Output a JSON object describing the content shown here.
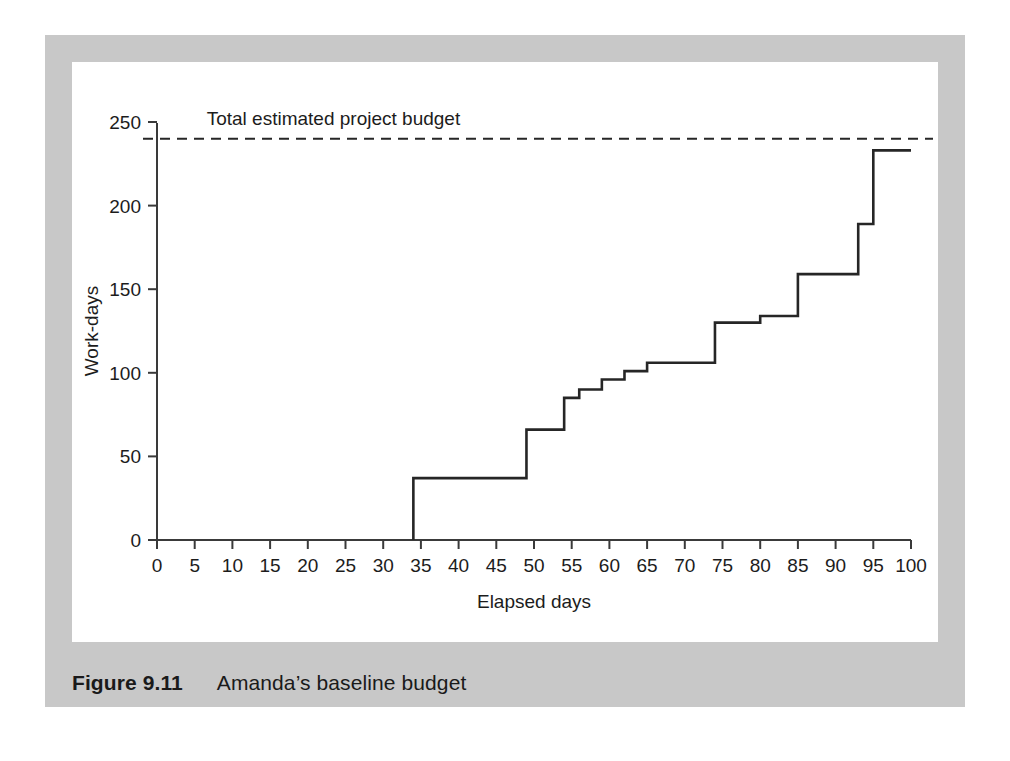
{
  "figure": {
    "caption_label": "Figure 9.11",
    "caption_text": "Amanda’s baseline budget",
    "panel_color": "#c8c8c8",
    "card_color": "#ffffff"
  },
  "chart_data": {
    "type": "line",
    "variant": "step",
    "title": "",
    "xlabel": "Elapsed days",
    "ylabel": "Work-days",
    "xlim": [
      0,
      100
    ],
    "ylim": [
      0,
      250
    ],
    "xticks": [
      0,
      5,
      10,
      15,
      20,
      25,
      30,
      35,
      40,
      45,
      50,
      55,
      60,
      65,
      70,
      75,
      80,
      85,
      90,
      95,
      100
    ],
    "yticks": [
      0,
      50,
      100,
      150,
      200,
      250
    ],
    "xtick_labels": [
      "0",
      "5",
      "10",
      "15",
      "20",
      "25",
      "30",
      "35",
      "40",
      "45",
      "50",
      "55",
      "60",
      "65",
      "70",
      "75",
      "80",
      "85",
      "90",
      "95",
      "100"
    ],
    "ytick_labels": [
      "0",
      "50",
      "100",
      "150",
      "200",
      "250"
    ],
    "grid": false,
    "legend": null,
    "series": [
      {
        "name": "Cumulative baseline budget",
        "color": "#262626",
        "line_width": 2.6,
        "x": [
          34,
          34,
          49,
          49,
          54,
          54,
          56,
          56,
          59,
          59,
          62,
          62,
          65,
          65,
          74,
          74,
          80,
          80,
          85,
          85,
          93,
          93,
          95,
          95,
          100
        ],
        "values": [
          0,
          37,
          37,
          66,
          66,
          85,
          85,
          90,
          90,
          96,
          96,
          101,
          101,
          106,
          106,
          130,
          130,
          134,
          134,
          159,
          159,
          189,
          189,
          233,
          233
        ]
      }
    ],
    "step_points": [
      {
        "day": 34,
        "work_days": 37
      },
      {
        "day": 49,
        "work_days": 66
      },
      {
        "day": 54,
        "work_days": 85
      },
      {
        "day": 56,
        "work_days": 90
      },
      {
        "day": 59,
        "work_days": 96
      },
      {
        "day": 62,
        "work_days": 101
      },
      {
        "day": 65,
        "work_days": 106
      },
      {
        "day": 74,
        "work_days": 130
      },
      {
        "day": 80,
        "work_days": 134
      },
      {
        "day": 85,
        "work_days": 159
      },
      {
        "day": 93,
        "work_days": 189
      },
      {
        "day": 95,
        "work_days": 233
      },
      {
        "day": 100,
        "work_days": 236
      }
    ],
    "reference_lines": [
      {
        "name": "total-estimated-project-budget",
        "label": "Total estimated project budget",
        "value": 240,
        "orientation": "horizontal",
        "style": "dashed",
        "color": "#262626"
      }
    ],
    "annotations": [
      {
        "text": "Total estimated project budget",
        "x": 5,
        "y": 252
      }
    ]
  }
}
